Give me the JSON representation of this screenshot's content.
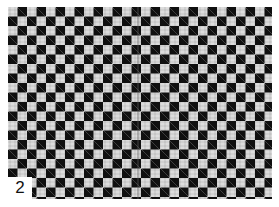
{
  "image": {
    "subject": "checkerboard pattern photograph",
    "colors": {
      "dark": "#151515",
      "light": "#d8d8d8",
      "background": "#ffffff"
    }
  },
  "label": {
    "text": "2"
  }
}
